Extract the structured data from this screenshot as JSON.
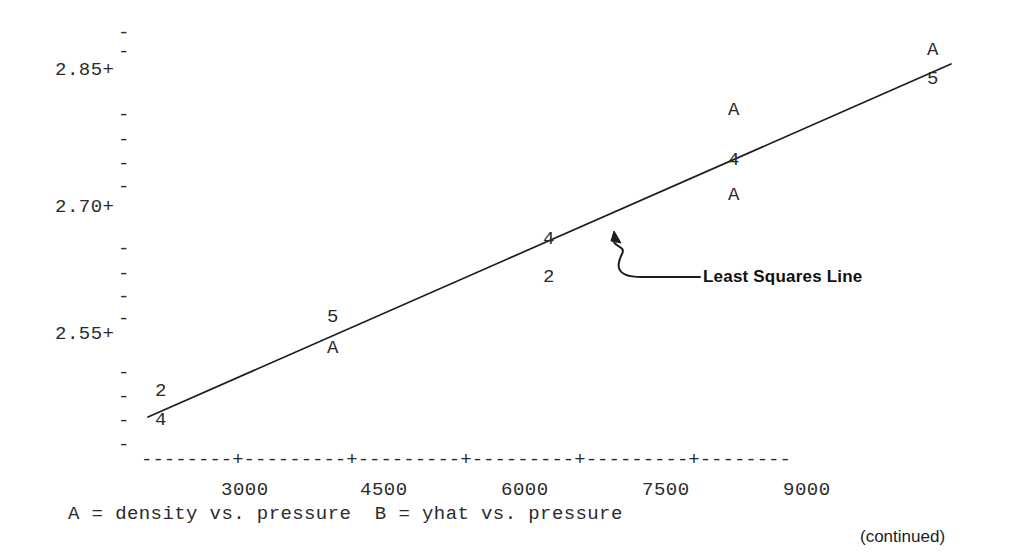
{
  "page": {
    "width": 1010,
    "height": 556,
    "background": "#ffffff",
    "ink": "#2b2b2b",
    "footer_note": "(continued)"
  },
  "annotation": {
    "label": "Least Squares Line",
    "target_x": 617,
    "target_y": 233
  },
  "caption": {
    "text": "A = density vs. pressure  B = yhat vs. pressure",
    "x": 68,
    "y": 505
  },
  "axis": {
    "x_rule": "--------+---------+---------+---------+---------+--------",
    "x_rule_x": 141,
    "x_rule_y": 458,
    "y_labels": [
      {
        "text": "2.85+",
        "x": 55,
        "y": 61
      },
      {
        "text": "2.70+",
        "x": 55,
        "y": 198
      },
      {
        "text": "2.55+",
        "x": 55,
        "y": 325
      }
    ],
    "y_ticks": [
      {
        "text": "-",
        "x": 118,
        "y": 24
      },
      {
        "text": "-",
        "x": 118,
        "y": 43
      },
      {
        "text": "-",
        "x": 118,
        "y": 106
      },
      {
        "text": "-",
        "x": 118,
        "y": 131
      },
      {
        "text": "-",
        "x": 118,
        "y": 155
      },
      {
        "text": "-",
        "x": 118,
        "y": 178
      },
      {
        "text": "-",
        "x": 118,
        "y": 240
      },
      {
        "text": "-",
        "x": 118,
        "y": 265
      },
      {
        "text": "-",
        "x": 118,
        "y": 288
      },
      {
        "text": "-",
        "x": 118,
        "y": 310
      },
      {
        "text": "-",
        "x": 118,
        "y": 364
      },
      {
        "text": "-",
        "x": 118,
        "y": 388
      },
      {
        "text": "-",
        "x": 118,
        "y": 412
      },
      {
        "text": "-",
        "x": 118,
        "y": 436
      }
    ],
    "x_labels": [
      {
        "text": "3000",
        "x": 221,
        "y": 481
      },
      {
        "text": "4500",
        "x": 360,
        "y": 481
      },
      {
        "text": "6000",
        "x": 501,
        "y": 481
      },
      {
        "text": "7500",
        "x": 642,
        "y": 481
      },
      {
        "text": "9000",
        "x": 783,
        "y": 481
      }
    ]
  },
  "chart_data": {
    "type": "scatter",
    "title": "",
    "xlabel": "pressure",
    "ylabel": "density",
    "xlim": [
      1500,
      10500
    ],
    "ylim": [
      2.46,
      2.93
    ],
    "yticks": [
      2.55,
      2.7,
      2.85
    ],
    "xticks": [
      3000,
      4500,
      6000,
      7500,
      9000
    ],
    "grid": false,
    "legend": "A = density vs. pressure  B = yhat vs. pressure",
    "marker_note": "Digits indicate the number of overplotted observations at that cell; 'A' marks a single density-vs-pressure observation.",
    "markers": [
      {
        "symbol": "2",
        "x": 155,
        "y": 382,
        "pressure": 2000,
        "density": 2.505
      },
      {
        "symbol": "4",
        "x": 155,
        "y": 411,
        "pressure": 2000,
        "density": 2.49,
        "count": 4
      },
      {
        "symbol": "5",
        "x": 327,
        "y": 308,
        "pressure": 4000,
        "density": 2.565,
        "count": 5
      },
      {
        "symbol": "A",
        "x": 327,
        "y": 339,
        "pressure": 4000,
        "density": 2.55
      },
      {
        "symbol": "4",
        "x": 543,
        "y": 230,
        "pressure": 6300,
        "density": 2.675,
        "count": 4
      },
      {
        "symbol": "2",
        "x": 543,
        "y": 268,
        "pressure": 6300,
        "density": 2.655,
        "count": 2
      },
      {
        "symbol": "A",
        "x": 728,
        "y": 101,
        "pressure": 8200,
        "density": 2.82
      },
      {
        "symbol": "4",
        "x": 728,
        "y": 151,
        "pressure": 8200,
        "density": 2.76,
        "count": 4
      },
      {
        "symbol": "A",
        "x": 728,
        "y": 186,
        "pressure": 8200,
        "density": 2.735
      },
      {
        "symbol": "A",
        "x": 927,
        "y": 41,
        "pressure": 10200,
        "density": 2.875
      },
      {
        "symbol": "5",
        "x": 927,
        "y": 70,
        "pressure": 10200,
        "density": 2.855,
        "count": 5
      }
    ],
    "fit_line": {
      "label": "Least Squares Line",
      "x1": 148,
      "y1": 417,
      "x2": 951,
      "y2": 64
    }
  }
}
